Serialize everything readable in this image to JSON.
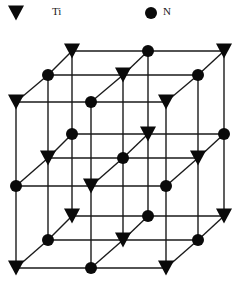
{
  "legend": {
    "items": [
      {
        "symbol": "triangle-down",
        "label": "Ti",
        "x": 16,
        "y": 13,
        "label_x": 52,
        "label_y": 15
      },
      {
        "symbol": "circle",
        "label": "N",
        "x": 151,
        "y": 13,
        "label_x": 163,
        "label_y": 15
      }
    ]
  },
  "lattice": {
    "description": "Rock-salt (NaCl-type) TiN crystal structure, 3x3x3 lattice points",
    "colors": {
      "line": "#1a1a1a",
      "node": "#0a0a0a"
    },
    "columns_x": {
      "front": [
        16,
        91,
        166
      ],
      "mid": [
        48,
        123,
        198
      ],
      "back": [
        72,
        148,
        224
      ]
    },
    "layers_y": {
      "top": {
        "back": 51,
        "mid": 75,
        "front": 102
      },
      "middle": {
        "back": 134,
        "mid": 158,
        "front": 186
      },
      "bottom": {
        "back": 216,
        "mid": 240,
        "front": 268
      }
    },
    "sites": {
      "top": {
        "back": [
          "Ti",
          "N",
          "Ti"
        ],
        "mid": [
          "N",
          "Ti",
          "N"
        ],
        "front": [
          "Ti",
          "N",
          "Ti"
        ]
      },
      "middle": {
        "back": [
          "N",
          "Ti",
          "N"
        ],
        "mid": [
          "Ti",
          "N",
          "Ti"
        ],
        "front": [
          "N",
          "Ti",
          "N"
        ]
      },
      "bottom": {
        "back": [
          "Ti",
          "N",
          "Ti"
        ],
        "mid": [
          "N",
          "Ti",
          "N"
        ],
        "front": [
          "Ti",
          "N",
          "Ti"
        ]
      }
    }
  }
}
